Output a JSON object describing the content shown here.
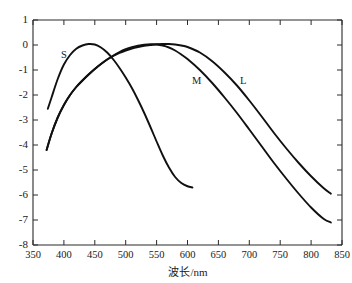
{
  "chart_data": {
    "type": "line",
    "title": "",
    "xlabel": "波长/nm",
    "ylabel": "",
    "xlim": [
      350,
      850
    ],
    "ylim": [
      -8,
      1
    ],
    "grid": false,
    "legend": "inline-curve-labels",
    "xticks": [
      350,
      400,
      450,
      500,
      550,
      600,
      650,
      700,
      750,
      800,
      850
    ],
    "yticks": [
      1,
      0,
      -1,
      -2,
      -3,
      -4,
      -5,
      -6,
      -7,
      -8
    ],
    "xtick_labels": [
      "350",
      "400",
      "450",
      "500",
      "550",
      "600",
      "650",
      "700",
      "750",
      "800",
      "850"
    ],
    "ytick_labels": [
      "1",
      "0",
      "-1",
      "-2",
      "-3",
      "-4",
      "-5",
      "-6",
      "-7",
      "-8"
    ],
    "series": [
      {
        "name": "S",
        "label": "S",
        "label_x": 400,
        "label_y": -0.5,
        "color": "#101010",
        "x": [
          374,
          380,
          390,
          400,
          410,
          420,
          430,
          440,
          450,
          460,
          470,
          480,
          490,
          500,
          510,
          520,
          530,
          540,
          550,
          560,
          570,
          580,
          590,
          600,
          608
        ],
        "y": [
          -2.55,
          -2.1,
          -1.36,
          -0.78,
          -0.4,
          -0.15,
          -0.02,
          0.04,
          0.02,
          -0.1,
          -0.3,
          -0.58,
          -0.92,
          -1.3,
          -1.72,
          -2.2,
          -2.72,
          -3.28,
          -3.86,
          -4.42,
          -4.9,
          -5.28,
          -5.52,
          -5.65,
          -5.7
        ]
      },
      {
        "name": "M",
        "label": "M",
        "label_x": 615,
        "label_y": -1.55,
        "color": "#101010",
        "x": [
          372,
          380,
          390,
          400,
          410,
          420,
          430,
          440,
          450,
          460,
          470,
          480,
          490,
          500,
          510,
          520,
          530,
          540,
          550,
          560,
          570,
          580,
          590,
          600,
          620,
          640,
          660,
          680,
          700,
          720,
          740,
          760,
          780,
          800,
          820,
          832
        ],
        "y": [
          -4.2,
          -3.55,
          -2.9,
          -2.4,
          -2.0,
          -1.68,
          -1.42,
          -1.18,
          -0.96,
          -0.76,
          -0.58,
          -0.42,
          -0.28,
          -0.17,
          -0.09,
          -0.03,
          0.01,
          0.03,
          0.02,
          -0.02,
          -0.1,
          -0.22,
          -0.38,
          -0.56,
          -1.0,
          -1.52,
          -2.1,
          -2.72,
          -3.38,
          -4.05,
          -4.72,
          -5.35,
          -5.95,
          -6.5,
          -6.95,
          -7.1
        ]
      },
      {
        "name": "L",
        "label": "L",
        "label_x": 690,
        "label_y": -1.55,
        "color": "#101010",
        "x": [
          372,
          380,
          390,
          400,
          410,
          420,
          430,
          440,
          450,
          460,
          470,
          480,
          490,
          500,
          510,
          520,
          530,
          540,
          550,
          560,
          570,
          580,
          590,
          600,
          620,
          640,
          660,
          680,
          700,
          720,
          740,
          760,
          780,
          800,
          820,
          832
        ],
        "y": [
          -4.2,
          -3.55,
          -2.9,
          -2.4,
          -2.0,
          -1.68,
          -1.42,
          -1.18,
          -0.96,
          -0.76,
          -0.58,
          -0.44,
          -0.32,
          -0.22,
          -0.14,
          -0.08,
          -0.03,
          0.0,
          0.03,
          0.04,
          0.04,
          0.02,
          -0.02,
          -0.08,
          -0.3,
          -0.65,
          -1.1,
          -1.62,
          -2.22,
          -2.86,
          -3.52,
          -4.14,
          -4.72,
          -5.25,
          -5.72,
          -5.95
        ]
      }
    ]
  }
}
